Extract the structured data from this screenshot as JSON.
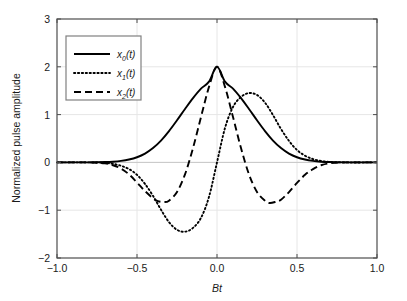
{
  "chart_data": {
    "type": "line",
    "title": "",
    "xlabel": "Bt",
    "ylabel": "Normalized pulse amplitude",
    "xlim": [
      -1.0,
      1.0
    ],
    "ylim": [
      -2,
      3
    ],
    "xticks": [
      "-1.0",
      "-0.5",
      "0.0",
      "0.5",
      "1.0"
    ],
    "xtick_values": [
      -1.0,
      -0.5,
      0.0,
      0.5,
      1.0
    ],
    "yticks": [
      "3",
      "2",
      "1",
      "0",
      "-1",
      "-2"
    ],
    "ytick_values": [
      3,
      2,
      1,
      0,
      -1,
      -2
    ],
    "grid": true,
    "legend_position": "upper left",
    "background": "#ffffff",
    "axis_color": "#4d4d4d",
    "grid_color": "#e6e6e6",
    "line_color": "#000000",
    "series": [
      {
        "name": "x0(t)",
        "label_base": "x",
        "label_sub": "0",
        "label_suffix": "(t)",
        "style": "solid",
        "peak_value": 2.0,
        "peak_x": 0.0,
        "x": [
          -1.0,
          -0.9,
          -0.8,
          -0.75,
          -0.7,
          -0.65,
          -0.6,
          -0.55,
          -0.5,
          -0.45,
          -0.4,
          -0.35,
          -0.3,
          -0.25,
          -0.2,
          -0.15,
          -0.1,
          -0.05,
          0.0,
          0.05,
          0.1,
          0.15,
          0.2,
          0.25,
          0.3,
          0.35,
          0.4,
          0.45,
          0.5,
          0.55,
          0.6,
          0.65,
          0.7,
          0.75,
          0.8,
          0.9,
          1.0
        ],
        "y": [
          0.0,
          0.0,
          0.001,
          0.003,
          0.007,
          0.015,
          0.031,
          0.06,
          0.108,
          0.185,
          0.3,
          0.457,
          0.655,
          0.882,
          1.118,
          1.345,
          1.543,
          1.689,
          2.0,
          1.689,
          1.543,
          1.345,
          1.118,
          0.882,
          0.655,
          0.457,
          0.3,
          0.185,
          0.108,
          0.06,
          0.031,
          0.015,
          0.007,
          0.003,
          0.001,
          0.0,
          0.0
        ]
      },
      {
        "name": "x1(t)",
        "label_base": "x",
        "label_sub": "1",
        "label_suffix": "(t)",
        "style": "dotted",
        "min_value": -1.45,
        "min_x": -0.2,
        "max_value": 1.45,
        "max_x": 0.2,
        "x": [
          -1.0,
          -0.8,
          -0.7,
          -0.65,
          -0.6,
          -0.55,
          -0.5,
          -0.45,
          -0.4,
          -0.35,
          -0.3,
          -0.25,
          -0.2,
          -0.15,
          -0.1,
          -0.05,
          0.0,
          0.05,
          0.1,
          0.15,
          0.2,
          0.25,
          0.3,
          0.35,
          0.4,
          0.45,
          0.5,
          0.55,
          0.6,
          0.65,
          0.7,
          0.8,
          1.0
        ],
        "y": [
          0.0,
          0.0,
          -0.01,
          -0.03,
          -0.07,
          -0.14,
          -0.26,
          -0.45,
          -0.7,
          -0.99,
          -1.25,
          -1.41,
          -1.45,
          -1.37,
          -1.16,
          -0.72,
          0.0,
          0.72,
          1.16,
          1.37,
          1.45,
          1.41,
          1.25,
          0.99,
          0.7,
          0.45,
          0.26,
          0.14,
          0.07,
          0.03,
          0.01,
          0.0,
          0.0
        ]
      },
      {
        "name": "x2(t)",
        "label_base": "x",
        "label_sub": "2",
        "label_suffix": "(t)",
        "style": "dashed",
        "peak_value": 2.0,
        "peak_x": 0.0,
        "side_min_value": -0.85,
        "side_min_x": 0.33,
        "x": [
          -1.0,
          -0.8,
          -0.7,
          -0.65,
          -0.6,
          -0.55,
          -0.5,
          -0.45,
          -0.4,
          -0.37,
          -0.33,
          -0.3,
          -0.25,
          -0.2,
          -0.15,
          -0.1,
          -0.05,
          0.0,
          0.05,
          0.1,
          0.15,
          0.2,
          0.25,
          0.3,
          0.33,
          0.37,
          0.4,
          0.45,
          0.5,
          0.55,
          0.6,
          0.65,
          0.7,
          0.8,
          1.0
        ],
        "y": [
          0.0,
          0.0,
          -0.02,
          -0.06,
          -0.13,
          -0.25,
          -0.42,
          -0.6,
          -0.75,
          -0.81,
          -0.83,
          -0.8,
          -0.62,
          -0.25,
          0.3,
          0.95,
          1.58,
          2.0,
          1.58,
          0.95,
          0.3,
          -0.25,
          -0.62,
          -0.8,
          -0.85,
          -0.82,
          -0.78,
          -0.62,
          -0.43,
          -0.26,
          -0.14,
          -0.06,
          -0.02,
          0.0,
          0.0
        ]
      }
    ]
  },
  "legend": {
    "items": [
      {
        "label": "x0(t)",
        "base": "x",
        "sub": "0",
        "suffix": "(t)",
        "style": "solid"
      },
      {
        "label": "x1(t)",
        "base": "x",
        "sub": "1",
        "suffix": "(t)",
        "style": "dotted"
      },
      {
        "label": "x2(t)",
        "base": "x",
        "sub": "2",
        "suffix": "(t)",
        "style": "dashed"
      }
    ]
  },
  "axes": {
    "x_label": "Bt",
    "y_label": "Normalized pulse amplitude",
    "x_tick_labels": [
      "-1.0",
      "-0.5",
      "0.0",
      "0.5",
      "1.0"
    ],
    "y_tick_labels": [
      "3",
      "2",
      "1",
      "0",
      "-1",
      "-2"
    ]
  }
}
